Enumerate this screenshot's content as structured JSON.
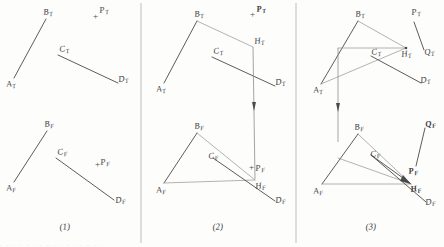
{
  "figure": {
    "background_color": "#fdfdfc",
    "line_color": "#4a4a4a",
    "light_line_color": "#9a9a9a",
    "divider_color": "#b5b5b5",
    "panels": [
      {
        "caption": "(1)",
        "views": {
          "top": {
            "labels": [
              "A",
              "B",
              "C",
              "D",
              "P"
            ],
            "subscript": "T"
          },
          "front": {
            "labels": [
              "A",
              "B",
              "C",
              "D",
              "P"
            ],
            "subscript": "F"
          }
        }
      },
      {
        "caption": "(2)",
        "views": {
          "top": {
            "labels": [
              "A",
              "B",
              "C",
              "D",
              "H",
              "P"
            ],
            "subscript": "T"
          },
          "front": {
            "labels": [
              "A",
              "B",
              "C",
              "D",
              "H",
              "P"
            ],
            "subscript": "F"
          }
        }
      },
      {
        "caption": "(3)",
        "views": {
          "top": {
            "labels": [
              "A",
              "B",
              "C",
              "D",
              "H",
              "P",
              "Q"
            ],
            "subscript": "T"
          },
          "front": {
            "labels": [
              "A",
              "B",
              "C",
              "D",
              "H",
              "P",
              "Q"
            ],
            "subscript": "F"
          }
        }
      }
    ]
  },
  "labels": {
    "p1": {
      "AT": "A",
      "BT": "B",
      "CT": "C",
      "DT": "D",
      "PT": "P",
      "AF": "A",
      "BF": "B",
      "CF": "C",
      "DF": "D",
      "PF": "P",
      "sub_T": "T",
      "sub_F": "F",
      "plus_T": "+",
      "plus_F": "+"
    },
    "p2": {
      "AT": "A",
      "BT": "B",
      "CT": "C",
      "DT": "D",
      "HT": "H",
      "PT": "P",
      "AF": "A",
      "BF": "B",
      "CF": "C",
      "DF": "D",
      "HF": "H",
      "PF": "P",
      "sub_T": "T",
      "sub_F": "F",
      "plus_T": "+",
      "plus_F": "+"
    },
    "p3": {
      "AT": "A",
      "BT": "B",
      "CT": "C",
      "DT": "D",
      "HT": "H",
      "PT": "P",
      "QT": "Q",
      "AF": "A",
      "BF": "B",
      "CF": "C",
      "DF": "D",
      "HF": "H",
      "PF": "P",
      "QF": "Q",
      "sub_T": "T",
      "sub_F": "F"
    }
  },
  "captions": {
    "panel1": "(1)",
    "panel2": "(2)",
    "panel3": "(3)"
  },
  "bottom_text": ". .   .  .    .    .   .   .    .    .  .   .   .   .  .  ."
}
